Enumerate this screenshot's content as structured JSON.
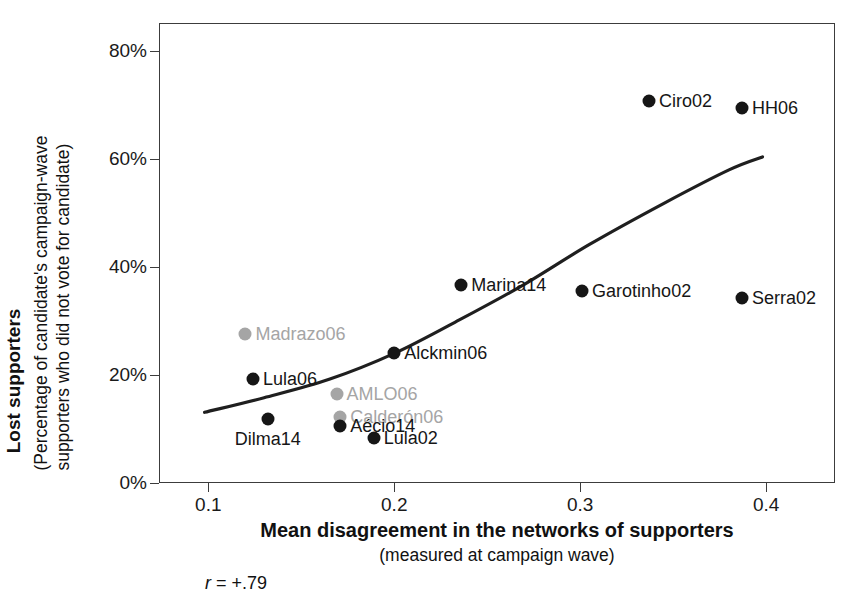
{
  "chart_data": {
    "type": "scatter",
    "title": "",
    "xlabel": "Mean disagreement in the networks of supporters",
    "xlabel_sub": "(measured at campaign wave)",
    "ylabel": "Lost supporters",
    "ylabel_sub_line1": "(Percentage of candidate's campaign-wave",
    "ylabel_sub_line2": "supporters who did not vote for candidate)",
    "annotation": "r = +.79",
    "annotation_symbol": "r",
    "annotation_value": "= +.79",
    "xlim": [
      0.0735,
      0.437
    ],
    "ylim": [
      0,
      85.2
    ],
    "grid": false,
    "legend": false,
    "xticks": [
      0.1,
      0.2,
      0.3,
      0.4
    ],
    "xtick_labels": [
      "0.1",
      "0.2",
      "0.3",
      "0.4"
    ],
    "yticks": [
      0,
      20,
      40,
      60,
      80
    ],
    "ytick_labels": [
      "0%",
      "20%",
      "40%",
      "60%",
      "80%"
    ],
    "colors": {
      "black_series": "#161616",
      "gray_series": "#a5a5a5",
      "trendline": "#1f1f1f",
      "axis": "#3c3c3c"
    },
    "points": [
      {
        "label": "Ciro02",
        "x": 0.337,
        "y": 70.7,
        "color": "black",
        "label_pos": "right"
      },
      {
        "label": "HH06",
        "x": 0.387,
        "y": 69.4,
        "color": "black",
        "label_pos": "right"
      },
      {
        "label": "Marina14",
        "x": 0.236,
        "y": 36.7,
        "color": "black",
        "label_pos": "right"
      },
      {
        "label": "Garotinho02",
        "x": 0.301,
        "y": 35.6,
        "color": "black",
        "label_pos": "right"
      },
      {
        "label": "Serra02",
        "x": 0.387,
        "y": 34.3,
        "color": "black",
        "label_pos": "right"
      },
      {
        "label": "Alckmin06",
        "x": 0.2,
        "y": 24.0,
        "color": "black",
        "label_pos": "right"
      },
      {
        "label": "Madrazo06",
        "x": 0.12,
        "y": 27.6,
        "color": "gray",
        "label_pos": "right"
      },
      {
        "label": "Lula06",
        "x": 0.124,
        "y": 19.3,
        "color": "black",
        "label_pos": "right"
      },
      {
        "label": "AMLO06",
        "x": 0.169,
        "y": 16.5,
        "color": "gray",
        "label_pos": "right"
      },
      {
        "label": "Calderón06",
        "x": 0.171,
        "y": 12.2,
        "color": "gray",
        "label_pos": "right"
      },
      {
        "label": "Aécio14",
        "x": 0.171,
        "y": 10.6,
        "color": "black",
        "label_pos": "right"
      },
      {
        "label": "Lula02",
        "x": 0.189,
        "y": 8.4,
        "color": "black",
        "label_pos": "right"
      },
      {
        "label": "Dilma14",
        "x": 0.132,
        "y": 11.9,
        "color": "black",
        "label_pos": "below"
      }
    ],
    "trendline": {
      "description": "fitted exponential-like curve",
      "points": [
        {
          "x": 0.098,
          "y": 13.1
        },
        {
          "x": 0.13,
          "y": 15.8
        },
        {
          "x": 0.165,
          "y": 19.2
        },
        {
          "x": 0.2,
          "y": 24.0
        },
        {
          "x": 0.235,
          "y": 30.2
        },
        {
          "x": 0.27,
          "y": 36.8
        },
        {
          "x": 0.305,
          "y": 44.2
        },
        {
          "x": 0.345,
          "y": 51.8
        },
        {
          "x": 0.38,
          "y": 58.0
        },
        {
          "x": 0.398,
          "y": 60.4
        }
      ]
    }
  }
}
